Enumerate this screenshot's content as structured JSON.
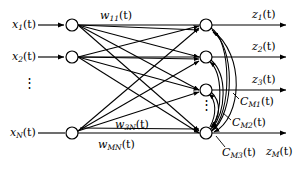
{
  "figure": {
    "type": "neural-network-diagram"
  },
  "inputs": {
    "ellipsis": "⋮",
    "items": [
      {
        "name": "input-x1",
        "base": "x",
        "sub": "1",
        "arg": "(t)",
        "y": 25
      },
      {
        "name": "input-x2",
        "base": "x",
        "sub": "2",
        "arg": "(t)",
        "y": 57
      },
      {
        "name": "input-xN",
        "base": "x",
        "sub": "N",
        "arg": "(t)",
        "y": 133
      }
    ]
  },
  "weights": [
    {
      "name": "weight-w11",
      "base": "w",
      "sub": "11",
      "arg": "(t)",
      "x": 100,
      "y": 12
    },
    {
      "name": "weight-w3N",
      "base": "w",
      "sub": "3N",
      "arg": "(t)",
      "x": 115,
      "y": 121
    },
    {
      "name": "weight-wMN",
      "base": "w",
      "sub": "MN",
      "arg": "(t)",
      "x": 98,
      "y": 140
    }
  ],
  "outputs": {
    "ellipsis": "⋮",
    "items": [
      {
        "name": "output-z1",
        "base": "z",
        "sub": "1",
        "arg": "(t)",
        "y": 25
      },
      {
        "name": "output-z2",
        "base": "z",
        "sub": "2",
        "arg": "(t)",
        "y": 57
      },
      {
        "name": "output-z3",
        "base": "z",
        "sub": "3",
        "arg": "(t)",
        "y": 90
      },
      {
        "name": "output-zM",
        "base": "z",
        "sub": "M",
        "arg": "(t)",
        "y": 133
      }
    ]
  },
  "feedback": [
    {
      "name": "feedback-CM1",
      "base": "C",
      "sub": "M1",
      "arg": "(t)",
      "x": 240,
      "y": 96
    },
    {
      "name": "feedback-CM2",
      "base": "C",
      "sub": "M2",
      "arg": "(t)",
      "x": 232,
      "y": 117
    },
    {
      "name": "feedback-CM3",
      "base": "C",
      "sub": "M3",
      "arg": "(t)",
      "x": 222,
      "y": 150
    }
  ],
  "colors": {
    "stroke": "#000000",
    "background": "#ffffff",
    "node_fill": "#ffffff"
  },
  "layout": {
    "input_node_x": 72,
    "output_node_x": 206,
    "node_radius": 6,
    "input_arrow_start_x": 38,
    "output_arrow_end_x": 288
  }
}
